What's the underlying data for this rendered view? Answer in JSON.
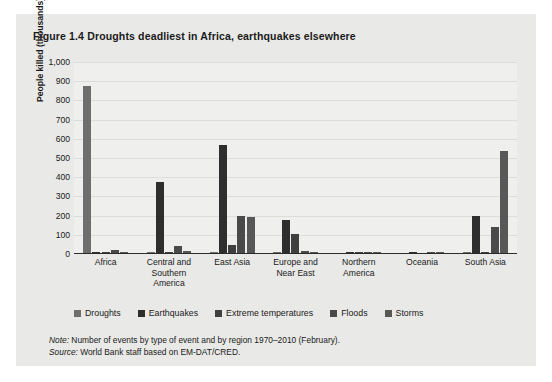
{
  "figure": {
    "title": "Figure 1.4  Droughts deadliest in Africa, earthquakes elsewhere",
    "note_label": "Note:",
    "note_text": " Number of events by type of event and by region 1970–2010 (February).",
    "source_label": "Source:",
    "source_text": " World Bank staff based on EM-DAT/CRED."
  },
  "chart_data": {
    "type": "bar",
    "title": "Figure 1.4  Droughts deadliest in Africa, earthquakes elsewhere",
    "xlabel": "",
    "ylabel": "People killed (thousands)",
    "ylim": [
      0,
      1000
    ],
    "ytick_labels": [
      "1,000",
      "900",
      "800",
      "700",
      "600",
      "500",
      "400",
      "300",
      "200",
      "100",
      "0"
    ],
    "ytick_values": [
      1000,
      900,
      800,
      700,
      600,
      500,
      400,
      300,
      200,
      100,
      0
    ],
    "grid": true,
    "legend_position": "bottom",
    "categories": [
      "Africa",
      "Central and Southern America",
      "East Asia",
      "Europe and Near East",
      "Northern America",
      "Oceania",
      "South Asia"
    ],
    "series": [
      {
        "name": "Droughts",
        "color": "#6e6e6e",
        "values": [
          870,
          2,
          4,
          2,
          0,
          0,
          6
        ]
      },
      {
        "name": "Earthquakes",
        "color": "#2e2e2e",
        "values": [
          3,
          370,
          560,
          170,
          2,
          1,
          195
        ]
      },
      {
        "name": "Extreme temperatures",
        "color": "#3f3f3f",
        "values": [
          1,
          5,
          40,
          100,
          2,
          0,
          4
        ]
      },
      {
        "name": "Floods",
        "color": "#4a4a4a",
        "values": [
          14,
          35,
          195,
          12,
          3,
          1,
          135
        ]
      },
      {
        "name": "Storms",
        "color": "#575757",
        "values": [
          3,
          8,
          190,
          6,
          6,
          3,
          530
        ]
      }
    ]
  }
}
